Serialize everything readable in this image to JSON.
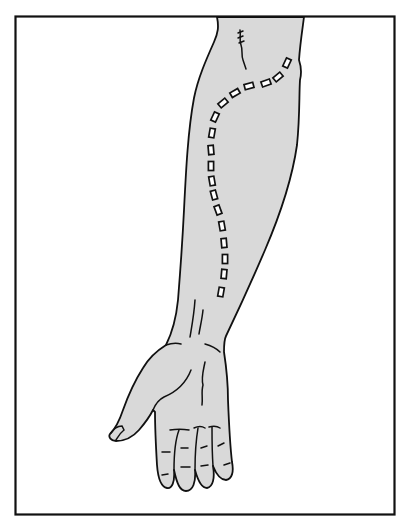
{
  "illustration": {
    "subject": "forearm and hand, palm view, with dashed route marking",
    "colors": {
      "background": "#ffffff",
      "frame": "#111111",
      "skin_fill": "#d9d9d9",
      "line": "#111111",
      "route_mark_fill": "#ffffff"
    },
    "frame": {
      "x": 15,
      "y": 16,
      "width": 380,
      "height": 499
    },
    "route_marks": [
      [
        287,
        63,
        -65
      ],
      [
        278,
        77,
        -40
      ],
      [
        266,
        83,
        -20
      ],
      [
        249,
        86,
        -15
      ],
      [
        235,
        93,
        -30
      ],
      [
        223,
        103,
        -40
      ],
      [
        215,
        117,
        -65
      ],
      [
        212,
        133,
        -80
      ],
      [
        211,
        150,
        85
      ],
      [
        211,
        166,
        90
      ],
      [
        212,
        181,
        80
      ],
      [
        214,
        195,
        75
      ],
      [
        218,
        210,
        70
      ],
      [
        222,
        226,
        80
      ],
      [
        224,
        243,
        85
      ],
      [
        225,
        259,
        90
      ],
      [
        224,
        274,
        95
      ],
      [
        221,
        292,
        100
      ]
    ]
  }
}
